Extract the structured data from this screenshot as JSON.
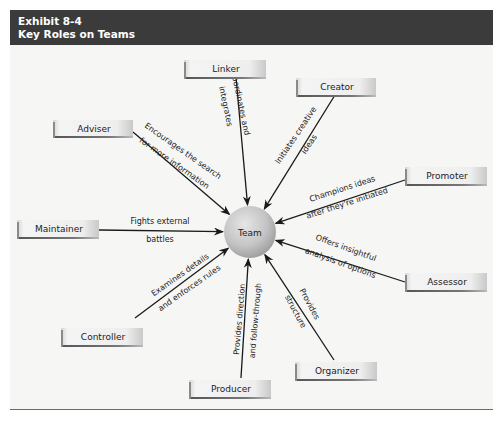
{
  "exhibit": {
    "number": "Exhibit 8-4",
    "title": "Key Roles on Teams"
  },
  "center": {
    "label": "Team"
  },
  "roles": [
    {
      "id": "linker",
      "label": "Linker",
      "description": [
        "Coordinates and",
        "integrates"
      ]
    },
    {
      "id": "creator",
      "label": "Creator",
      "description": [
        "Initiates creative",
        "ideas"
      ]
    },
    {
      "id": "adviser",
      "label": "Adviser",
      "description": [
        "Encourages the search",
        "for more information"
      ]
    },
    {
      "id": "promoter",
      "label": "Promoter",
      "description": [
        "Champions ideas",
        "after they're initiated"
      ]
    },
    {
      "id": "maintainer",
      "label": "Maintainer",
      "description": [
        "Fights external",
        "battles"
      ]
    },
    {
      "id": "assessor",
      "label": "Assessor",
      "description": [
        "Offers insightful",
        "analysis of options"
      ]
    },
    {
      "id": "controller",
      "label": "Controller",
      "description": [
        "Examines details",
        "and enforces rules"
      ]
    },
    {
      "id": "organizer",
      "label": "Organizer",
      "description": [
        "Provides",
        "structure"
      ]
    },
    {
      "id": "producer",
      "label": "Producer",
      "description": [
        "Provides direction",
        "and follow-through"
      ]
    }
  ],
  "colors": {
    "header_bg": "#3b3b3b",
    "header_text": "#ffffff",
    "arrow": "#1a1a1a",
    "circle_light": "#e4e4e4",
    "circle_dark": "#9a9a9a"
  }
}
